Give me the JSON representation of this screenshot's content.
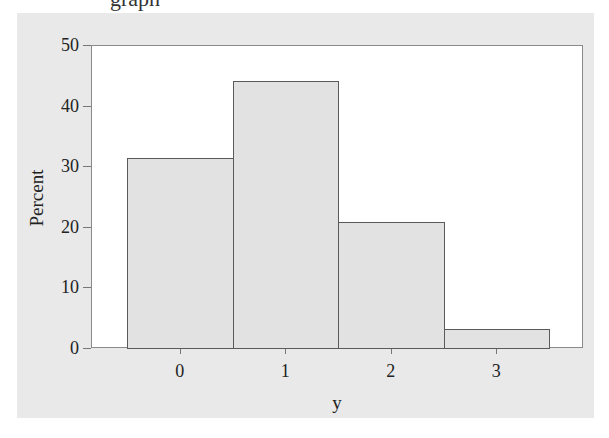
{
  "page": {
    "top_fragment": "graph"
  },
  "chart_data": {
    "type": "bar",
    "title": "",
    "xlabel": "y",
    "ylabel": "Percent",
    "categories": [
      "0",
      "1",
      "2",
      "3"
    ],
    "values": [
      31.4,
      44.1,
      20.8,
      3.1
    ],
    "ylim": [
      0,
      50
    ],
    "yticks": [
      "0",
      "10",
      "20",
      "30",
      "40",
      "50"
    ],
    "xticks": [
      "0",
      "1",
      "2",
      "3"
    ],
    "grid": false,
    "legend": null,
    "colors": {
      "bar_fill": "#e2e2e2",
      "bar_edge": "#5a5a5a",
      "panel_bg": "#e9e9e9",
      "plot_bg": "#ffffff"
    }
  }
}
